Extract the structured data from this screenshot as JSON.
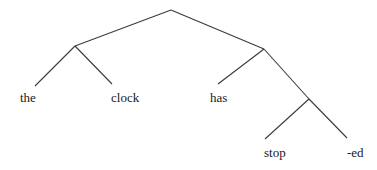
{
  "diagram": {
    "type": "syntax-tree",
    "colors": {
      "edge": "#3a3a3a",
      "text": "#1a1a1a",
      "background": "#ffffff"
    },
    "nodes": [
      {
        "id": "root",
        "x": 171,
        "y": 10
      },
      {
        "id": "left",
        "x": 75,
        "y": 46
      },
      {
        "id": "right",
        "x": 264,
        "y": 49
      },
      {
        "id": "lower",
        "x": 309,
        "y": 99
      }
    ],
    "leaves": [
      {
        "id": "the",
        "label": "the",
        "line_end": [
          35,
          86
        ],
        "text_x": 20,
        "text_y": 102
      },
      {
        "id": "clock",
        "label": "clock",
        "line_end": [
          112,
          84
        ],
        "text_x": 111,
        "text_y": 102
      },
      {
        "id": "has",
        "label": "has",
        "line_end": [
          218,
          84
        ],
        "text_x": 210,
        "text_y": 102
      },
      {
        "id": "stop",
        "label": "stop",
        "line_end": [
          265,
          139
        ],
        "text_x": 264,
        "text_y": 157
      },
      {
        "id": "ed",
        "label": "-ed",
        "line_end": [
          347,
          138
        ],
        "text_x": 347,
        "text_y": 157
      }
    ],
    "edges": [
      [
        "root",
        "left"
      ],
      [
        "root",
        "right"
      ],
      [
        "left",
        "the"
      ],
      [
        "left",
        "clock"
      ],
      [
        "right",
        "has"
      ],
      [
        "right",
        "lower"
      ],
      [
        "lower",
        "stop"
      ],
      [
        "lower",
        "ed"
      ]
    ]
  }
}
